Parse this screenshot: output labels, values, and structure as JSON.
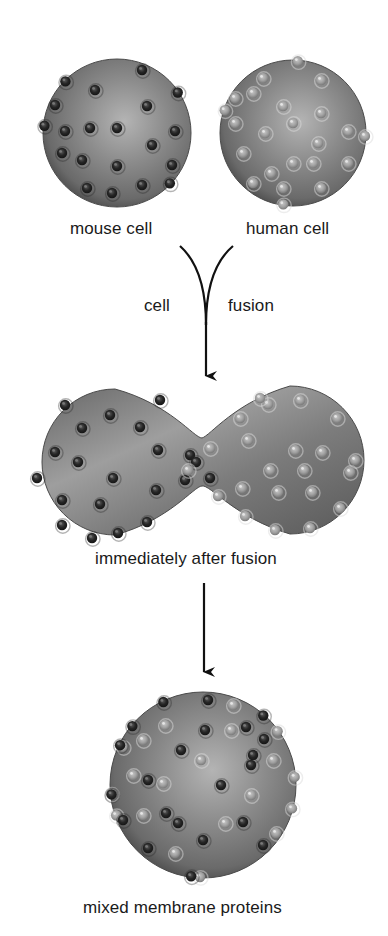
{
  "figure": {
    "colors": {
      "background": "#ffffff",
      "membrane_base": "#7a7a7a",
      "membrane_highlight": "#b4b4b4",
      "membrane_edge": "#4a4a4a",
      "mouse_protein": "#262626",
      "human_protein": "#a6a6a6",
      "arrow": "#111111",
      "text": "#1a1a1a"
    },
    "stage1": {
      "mouse_cell": {
        "label": "mouse cell",
        "protein_type": "mouse",
        "cx": 117,
        "cy": 133,
        "r": 74,
        "proteins": [
          [
            -55,
            -55
          ],
          [
            25,
            -63
          ],
          [
            -22,
            -43
          ],
          [
            30,
            -27
          ],
          [
            60,
            -40
          ],
          [
            -62,
            -28
          ],
          [
            -52,
            -2
          ],
          [
            -27,
            -5
          ],
          [
            0,
            -5
          ],
          [
            58,
            -2
          ],
          [
            35,
            12
          ],
          [
            -55,
            20
          ],
          [
            -35,
            27
          ],
          [
            0,
            33
          ],
          [
            55,
            32
          ],
          [
            -30,
            55
          ],
          [
            -5,
            60
          ],
          [
            25,
            52
          ],
          [
            -80,
            -8
          ],
          [
            63,
            60
          ]
        ]
      },
      "human_cell": {
        "label": "human cell",
        "protein_type": "human",
        "cx": 293,
        "cy": 133,
        "r": 73,
        "proteins": [
          [
            -30,
            -55
          ],
          [
            28,
            -53
          ],
          [
            -58,
            -35
          ],
          [
            -40,
            -40
          ],
          [
            -10,
            -27
          ],
          [
            28,
            -20
          ],
          [
            55,
            -2
          ],
          [
            -58,
            -10
          ],
          [
            -28,
            0
          ],
          [
            0,
            -10
          ],
          [
            25,
            10
          ],
          [
            -50,
            20
          ],
          [
            -22,
            40
          ],
          [
            0,
            30
          ],
          [
            20,
            30
          ],
          [
            55,
            30
          ],
          [
            -40,
            50
          ],
          [
            -10,
            55
          ],
          [
            28,
            55
          ],
          [
            -75,
            -25
          ],
          [
            72,
            3
          ],
          [
            5,
            -75
          ],
          [
            -10,
            73
          ]
        ]
      }
    },
    "arrow1": {
      "left_label": "cell",
      "right_label": "fusion"
    },
    "stage2": {
      "label": "immediately after fusion",
      "left_lobe": {
        "cx": 115,
        "cy": 462,
        "r": 73
      },
      "right_lobe": {
        "cx": 290,
        "cy": 460,
        "r": 74
      },
      "neck": {
        "x": 202,
        "half_height": 24
      },
      "mouse_proteins": [
        [
          65,
          405
        ],
        [
          82,
          428
        ],
        [
          110,
          415
        ],
        [
          140,
          427
        ],
        [
          160,
          400
        ],
        [
          55,
          452
        ],
        [
          78,
          462
        ],
        [
          113,
          478
        ],
        [
          158,
          450
        ],
        [
          190,
          455
        ],
        [
          62,
          500
        ],
        [
          100,
          504
        ],
        [
          156,
          490
        ],
        [
          185,
          480
        ],
        [
          62,
          525
        ],
        [
          92,
          538
        ],
        [
          118,
          533
        ],
        [
          147,
          522
        ],
        [
          37,
          478
        ],
        [
          196,
          462
        ],
        [
          210,
          478
        ]
      ],
      "human_proteins": [
        [
          240,
          418
        ],
        [
          268,
          404
        ],
        [
          300,
          400
        ],
        [
          337,
          418
        ],
        [
          248,
          440
        ],
        [
          295,
          450
        ],
        [
          322,
          452
        ],
        [
          355,
          460
        ],
        [
          242,
          488
        ],
        [
          270,
          470
        ],
        [
          304,
          470
        ],
        [
          278,
          492
        ],
        [
          312,
          492
        ],
        [
          350,
          472
        ],
        [
          245,
          516
        ],
        [
          275,
          530
        ],
        [
          310,
          528
        ],
        [
          340,
          508
        ],
        [
          210,
          448
        ],
        [
          218,
          496
        ],
        [
          188,
          470
        ],
        [
          260,
          398
        ]
      ]
    },
    "arrow2": {},
    "stage3": {
      "label": "mixed membrane proteins",
      "cx": 203,
      "cy": 785,
      "r": 93,
      "mouse_proteins": [
        [
          -43,
          -90
        ],
        [
          5,
          -85
        ],
        [
          43,
          -58
        ],
        [
          61,
          -46
        ],
        [
          -72,
          -60
        ],
        [
          2,
          -55
        ],
        [
          -100,
          -48
        ],
        [
          -22,
          -35
        ],
        [
          50,
          -30
        ],
        [
          -55,
          -5
        ],
        [
          48,
          -20
        ],
        [
          18,
          0
        ],
        [
          -37,
          28
        ],
        [
          -25,
          38
        ],
        [
          0,
          55
        ],
        [
          40,
          37
        ],
        [
          -80,
          35
        ],
        [
          -55,
          63
        ],
        [
          -12,
          92
        ],
        [
          60,
          60
        ],
        [
          -97,
          10
        ],
        [
          78,
          -90
        ]
      ],
      "human_proteins": [
        [
          30,
          -80
        ],
        [
          -38,
          -60
        ],
        [
          -60,
          -45
        ],
        [
          28,
          -55
        ],
        [
          90,
          -65
        ],
        [
          -70,
          -10
        ],
        [
          -2,
          -25
        ],
        [
          113,
          -10
        ],
        [
          -80,
          -38
        ],
        [
          -40,
          -2
        ],
        [
          48,
          10
        ],
        [
          -105,
          10
        ],
        [
          -60,
          30
        ],
        [
          22,
          38
        ],
        [
          73,
          48
        ],
        [
          -28,
          68
        ],
        [
          -3,
          92
        ],
        [
          -115,
          40
        ],
        [
          70,
          -25
        ],
        [
          95,
          25
        ]
      ]
    }
  }
}
